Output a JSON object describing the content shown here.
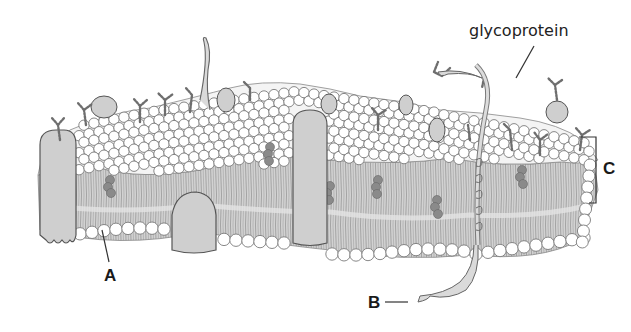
{
  "diagram": {
    "labels": {
      "glycoprotein": "glycoprotein",
      "a": "A",
      "b": "B",
      "c": "C"
    },
    "colors": {
      "background": "#ffffff",
      "phospholipid_head_fill": "#ffffff",
      "phospholipid_head_stroke": "#777777",
      "tail_region": "#c9c9c9",
      "tail_lines": "#8a8a8a",
      "protein_fill": "#cfcfcf",
      "protein_stroke": "#555555",
      "cholesterol": "#8a8a8a",
      "carbohydrate_chain": "#777777",
      "label_text": "#1a1a1a"
    }
  }
}
